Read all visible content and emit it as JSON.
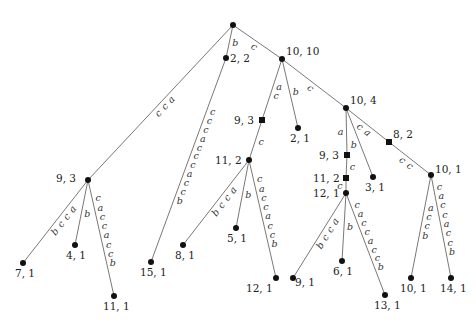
{
  "diagram": {
    "type": "suffix-tree",
    "nodes": [
      {
        "id": "root",
        "label": "",
        "x": 233,
        "y": 25,
        "shape": "dot",
        "lx": 0,
        "ly": 0
      },
      {
        "id": "n2_2",
        "label": "2, 2",
        "x": 226,
        "y": 58,
        "shape": "dot",
        "lx": 4,
        "ly": 4
      },
      {
        "id": "n10_10",
        "label": "10, 10",
        "x": 282,
        "y": 59,
        "shape": "dot",
        "lx": 4,
        "ly": -4
      },
      {
        "id": "n9_3a",
        "label": "9, 3",
        "x": 88,
        "y": 180,
        "shape": "dot",
        "lx": -32,
        "ly": 2
      },
      {
        "id": "n7_1",
        "label": "7, 1",
        "x": 23,
        "y": 263,
        "shape": "dot",
        "lx": -8,
        "ly": 14
      },
      {
        "id": "n4_1",
        "label": "4, 1",
        "x": 75,
        "y": 245,
        "shape": "dot",
        "lx": -9,
        "ly": 14
      },
      {
        "id": "n11_1",
        "label": "11, 1",
        "x": 114,
        "y": 296,
        "shape": "dot",
        "lx": -11,
        "ly": 14
      },
      {
        "id": "n15_1",
        "label": "15, 1",
        "x": 151,
        "y": 262,
        "shape": "dot",
        "lx": -11,
        "ly": 14
      },
      {
        "id": "n9_3b",
        "label": "9, 3",
        "x": 262,
        "y": 120,
        "shape": "square",
        "lx": -28,
        "ly": 4
      },
      {
        "id": "n2_1",
        "label": "2, 1",
        "x": 298,
        "y": 128,
        "shape": "dot",
        "lx": -8,
        "ly": 14
      },
      {
        "id": "n11_2a",
        "label": "11, 2",
        "x": 249,
        "y": 160,
        "shape": "dot",
        "lx": -34,
        "ly": 4
      },
      {
        "id": "n8_1",
        "label": "8, 1",
        "x": 183,
        "y": 245,
        "shape": "dot",
        "lx": -8,
        "ly": 14
      },
      {
        "id": "n5_1",
        "label": "5, 1",
        "x": 236,
        "y": 228,
        "shape": "dot",
        "lx": -9,
        "ly": 14
      },
      {
        "id": "n12_1a",
        "label": "12, 1",
        "x": 276,
        "y": 278,
        "shape": "dot",
        "lx": -30,
        "ly": 14
      },
      {
        "id": "n10_4",
        "label": "10, 4",
        "x": 346,
        "y": 108,
        "shape": "dot",
        "lx": 4,
        "ly": -4
      },
      {
        "id": "n9_3c",
        "label": "9, 3",
        "x": 347,
        "y": 155,
        "shape": "square",
        "lx": -28,
        "ly": 4
      },
      {
        "id": "n11_2b",
        "label": "11, 2",
        "x": 346,
        "y": 178,
        "shape": "square",
        "lx": -33,
        "ly": 4
      },
      {
        "id": "n12_1b",
        "label": "12, 1",
        "x": 346,
        "y": 193,
        "shape": "dot",
        "lx": -33,
        "ly": 4
      },
      {
        "id": "n3_1",
        "label": "3, 1",
        "x": 373,
        "y": 177,
        "shape": "dot",
        "lx": -8,
        "ly": 14
      },
      {
        "id": "n8_2",
        "label": "8, 2",
        "x": 389,
        "y": 142,
        "shape": "square",
        "lx": 4,
        "ly": -4
      },
      {
        "id": "n10_1a",
        "label": "10, 1",
        "x": 431,
        "y": 175,
        "shape": "dot",
        "lx": 4,
        "ly": -2
      },
      {
        "id": "n9_1",
        "label": "9, 1",
        "x": 293,
        "y": 278,
        "shape": "dot",
        "lx": 2,
        "ly": 8
      },
      {
        "id": "n6_1",
        "label": "6, 1",
        "x": 342,
        "y": 261,
        "shape": "dot",
        "lx": -9,
        "ly": 14
      },
      {
        "id": "n13_1",
        "label": "13, 1",
        "x": 385,
        "y": 295,
        "shape": "dot",
        "lx": -11,
        "ly": 14
      },
      {
        "id": "n10_1b",
        "label": "10, 1",
        "x": 411,
        "y": 278,
        "shape": "dot",
        "lx": -11,
        "ly": 14
      },
      {
        "id": "n14_1",
        "label": "14, 1",
        "x": 451,
        "y": 278,
        "shape": "dot",
        "lx": -11,
        "ly": 14
      }
    ],
    "edges": [
      {
        "from": "root",
        "to": "n9_3a",
        "label": "acc",
        "side": -1
      },
      {
        "from": "root",
        "to": "n2_2",
        "label": "b",
        "side": -1
      },
      {
        "from": "root",
        "to": "n10_10",
        "label": "c",
        "side": -1
      },
      {
        "from": "n2_2",
        "to": "n15_1",
        "label": "cccacccaccb",
        "side": -1
      },
      {
        "from": "n9_3a",
        "to": "n7_1",
        "label": "accb",
        "side": -1
      },
      {
        "from": "n9_3a",
        "to": "n4_1",
        "label": "b",
        "side": -1
      },
      {
        "from": "n9_3a",
        "to": "n11_1",
        "label": "caccaccb",
        "side": 1
      },
      {
        "from": "n10_10",
        "to": "n9_3b",
        "label": "ac",
        "side": -1
      },
      {
        "from": "n10_10",
        "to": "n2_1",
        "label": "b",
        "side": 1
      },
      {
        "from": "n10_10",
        "to": "n10_4",
        "label": "c",
        "side": -1
      },
      {
        "from": "n9_3b",
        "to": "n11_2a",
        "label": "c",
        "side": -1
      },
      {
        "from": "n11_2a",
        "to": "n8_1",
        "label": "accb",
        "side": -1
      },
      {
        "from": "n11_2a",
        "to": "n5_1",
        "label": "b",
        "side": -1
      },
      {
        "from": "n11_2a",
        "to": "n12_1a",
        "label": "caccaccb",
        "side": 1
      },
      {
        "from": "n10_4",
        "to": "n9_3c",
        "label": "a",
        "side": -1
      },
      {
        "from": "n10_4",
        "to": "n3_1",
        "label": "b",
        "side": -1
      },
      {
        "from": "n10_4",
        "to": "n8_2",
        "label": "ca",
        "side": -1
      },
      {
        "from": "n9_3c",
        "to": "n11_2b",
        "label": "c",
        "side": -1
      },
      {
        "from": "n11_2b",
        "to": "n12_1b",
        "label": "c",
        "side": -1
      },
      {
        "from": "n12_1b",
        "to": "n9_1",
        "label": "accb",
        "side": -1
      },
      {
        "from": "n12_1b",
        "to": "n6_1",
        "label": "b",
        "side": -1
      },
      {
        "from": "n12_1b",
        "to": "n13_1",
        "label": "caccaccb",
        "side": 1
      },
      {
        "from": "n8_2",
        "to": "n10_1a",
        "label": "cc",
        "side": -1
      },
      {
        "from": "n10_1a",
        "to": "n10_1b",
        "label": "accb",
        "side": -1
      },
      {
        "from": "n10_1a",
        "to": "n14_1",
        "label": "caccaccb",
        "side": 1
      }
    ],
    "colors": {
      "edge": "#555555",
      "node": "#111111",
      "text": "#222222"
    }
  }
}
